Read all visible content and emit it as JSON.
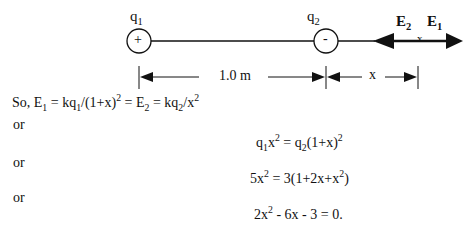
{
  "diagram": {
    "charge1": {
      "label": "q",
      "sub": "1",
      "sign": "+"
    },
    "charge2": {
      "label": "q",
      "sub": "2",
      "sign": "-"
    },
    "field2": {
      "label": "E",
      "sub": "2"
    },
    "field1": {
      "label": "E",
      "sub": "1"
    },
    "point_marker": "x",
    "distance1": "1.0 m",
    "distance2": "x"
  },
  "text": {
    "line1": {
      "prefix": "So, E",
      "s1": "1",
      "p2": " = kq",
      "s2": "1",
      "p3": "/(1+x)",
      "sup1": "2",
      "p4": " = E",
      "s3": "2",
      "p5": " = kq",
      "s4": "2",
      "p6": "/x",
      "sup2": "2"
    },
    "or": "or",
    "eq1": {
      "a": "q",
      "s1": "1",
      "b": "x",
      "sup1": "2",
      "c": " = q",
      "s2": "2",
      "d": "(1+x)",
      "sup2": "2"
    },
    "eq2": {
      "a": "5x",
      "sup1": "2",
      "b": " = 3(1+2x+x",
      "sup2": "2",
      "c": ")"
    },
    "eq3": {
      "a": "2x",
      "sup1": "2",
      "b": " - 6x - 3 = 0."
    }
  }
}
